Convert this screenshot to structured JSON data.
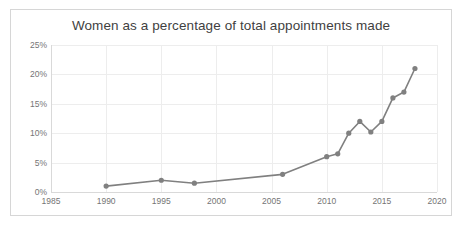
{
  "chart_data": {
    "type": "line",
    "title": "Women as a percentage of total appointments made",
    "xlabel": "",
    "ylabel": "",
    "xlim": [
      1985,
      2020
    ],
    "ylim": [
      0,
      25
    ],
    "grid": true,
    "legend": false,
    "line_color": "#808080",
    "marker": "circle",
    "marker_color": "#808080",
    "x_ticks": [
      "1985",
      "1990",
      "1995",
      "2000",
      "2005",
      "2010",
      "2015",
      "2020"
    ],
    "x_tick_values": [
      1985,
      1990,
      1995,
      2000,
      2005,
      2010,
      2015,
      2020
    ],
    "y_ticks": [
      "0%",
      "5%",
      "10%",
      "15%",
      "20%",
      "25%"
    ],
    "y_tick_values": [
      0,
      5,
      10,
      15,
      20,
      25
    ],
    "series": [
      {
        "name": "Women as a percentage of total appointments made",
        "x": [
          1990,
          1995,
          1998,
          2006,
          2010,
          2011,
          2012,
          2013,
          2014,
          2015,
          2016,
          2017,
          2018
        ],
        "values": [
          1.0,
          2.0,
          1.5,
          3.0,
          6.0,
          6.5,
          10.0,
          12.0,
          10.2,
          12.0,
          16.0,
          17.0,
          21.0
        ]
      }
    ]
  }
}
